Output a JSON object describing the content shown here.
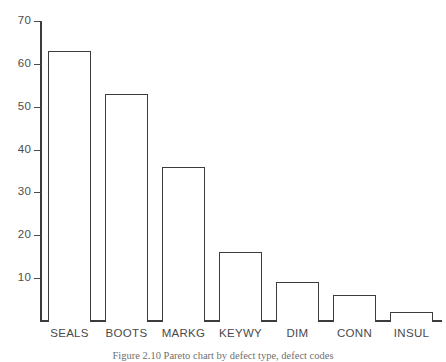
{
  "chart_data": {
    "type": "bar",
    "title": "",
    "subtitle": "",
    "xlabel": "",
    "ylabel": "",
    "categories": [
      "SEALS",
      "BOOTS",
      "MARKG",
      "KEYWY",
      "DIM",
      "CONN",
      "INSUL"
    ],
    "values": [
      63,
      53,
      36,
      16,
      9,
      6,
      2
    ],
    "ylim": [
      0,
      70
    ],
    "yticks": [
      10,
      20,
      30,
      40,
      50,
      60,
      70
    ],
    "ytick_labels": [
      "10",
      "20",
      "30",
      "40",
      "50",
      "60",
      "70"
    ],
    "grid": false,
    "legend": null,
    "bar_style": {
      "fill": "#ffffff",
      "outline": "#3c3c3c"
    },
    "axis_color": "#3c3c3c",
    "background": "#ffffff",
    "annotations": []
  },
  "caption": {
    "text": "Figure 2.10   Pareto chart by defect type, defect codes"
  }
}
